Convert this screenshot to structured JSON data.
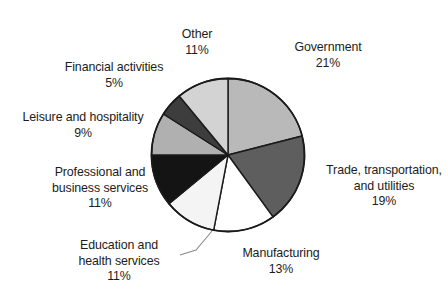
{
  "chart_data": {
    "type": "pie",
    "title": "",
    "subtitle": "",
    "xlabel": "",
    "ylabel": "",
    "legend_position": "none",
    "grid": false,
    "start_angle_deg": 0,
    "direction": "clockwise",
    "unit": "percent",
    "categories": [
      "Government",
      "Trade, transportation, and utilities",
      "Manufacturing",
      "Education and health services",
      "Professional and business services",
      "Leisure and hospitality",
      "Financial activities",
      "Other"
    ],
    "values": [
      21,
      19,
      13,
      11,
      11,
      9,
      5,
      11
    ],
    "colors": [
      "#b9b9b9",
      "#5e5e5e",
      "#ffffff",
      "#f4f4f4",
      "#141414",
      "#b0b0b0",
      "#3d3d3d",
      "#d3d3d3"
    ],
    "slices": [
      {
        "name": "Government",
        "value": 21,
        "value_label": "21%",
        "color": "#b9b9b9",
        "label_lines": [
          "Government"
        ]
      },
      {
        "name": "Trade, transportation, and utilities",
        "value": 19,
        "value_label": "19%",
        "color": "#5e5e5e",
        "label_lines": [
          "Trade, transportation,",
          "and utilities"
        ]
      },
      {
        "name": "Manufacturing",
        "value": 13,
        "value_label": "13%",
        "color": "#ffffff",
        "label_lines": [
          "Manufacturing"
        ]
      },
      {
        "name": "Education and health services",
        "value": 11,
        "value_label": "11%",
        "color": "#f4f4f4",
        "label_lines": [
          "Education and",
          "health services"
        ]
      },
      {
        "name": "Professional and business services",
        "value": 11,
        "value_label": "11%",
        "color": "#141414",
        "label_lines": [
          "Professional and",
          "business services"
        ]
      },
      {
        "name": "Leisure and hospitality",
        "value": 9,
        "value_label": "9%",
        "color": "#b0b0b0",
        "label_lines": [
          "Leisure and hospitality"
        ]
      },
      {
        "name": "Financial activities",
        "value": 5,
        "value_label": "5%",
        "color": "#3d3d3d",
        "label_lines": [
          "Financial activities"
        ]
      },
      {
        "name": "Other",
        "value": 11,
        "value_label": "11%",
        "color": "#d3d3d3",
        "label_lines": [
          "Other"
        ]
      }
    ]
  },
  "labels": {
    "government": {
      "line1": "Government",
      "pct": "21%"
    },
    "trade": {
      "line1": "Trade, transportation,",
      "line2": "and utilities",
      "pct": "19%"
    },
    "manufacturing": {
      "line1": "Manufacturing",
      "pct": "13%"
    },
    "education": {
      "line1": "Education and",
      "line2": "health services",
      "pct": "11%"
    },
    "professional": {
      "line1": "Professional and",
      "line2": "business services",
      "pct": "11%"
    },
    "leisure": {
      "line1": "Leisure and hospitality",
      "pct": "9%"
    },
    "financial": {
      "line1": "Financial activities",
      "pct": "5%"
    },
    "other": {
      "line1": "Other",
      "pct": "11%"
    }
  },
  "style": {
    "outline_color": "#1a1a1a",
    "text_color": "#1c1c1c",
    "leader_color": "#8a8a8a",
    "background": "#ffffff"
  }
}
